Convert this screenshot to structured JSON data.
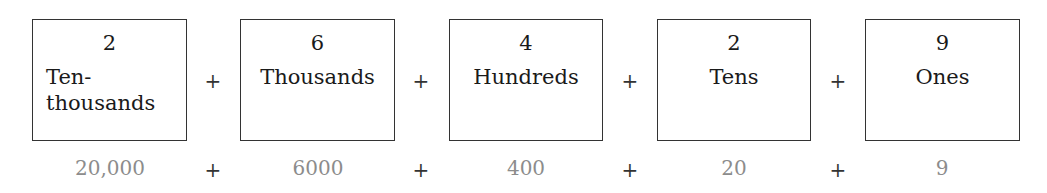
{
  "places": [
    {
      "digit": "2",
      "label_line1": "Ten-",
      "label_line2": "thousands",
      "value": "20,000"
    },
    {
      "digit": "6",
      "label_line1": "Thousands",
      "label_line2": "",
      "value": "6000"
    },
    {
      "digit": "4",
      "label_line1": "Hundreds",
      "label_line2": "",
      "value": "400"
    },
    {
      "digit": "2",
      "label_line1": "Tens",
      "label_line2": "",
      "value": "20"
    },
    {
      "digit": "9",
      "label_line1": "Ones",
      "label_line2": "",
      "value": "9"
    }
  ],
  "operator": "+",
  "colors": {
    "value_text": "#8c8c8c",
    "box_border": "#333333"
  }
}
